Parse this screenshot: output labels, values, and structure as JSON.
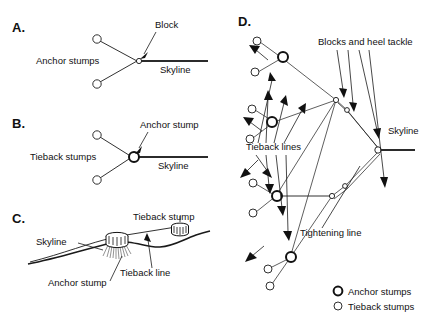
{
  "figure": {
    "background_color": "#ffffff",
    "ink_color": "#1a1a1a",
    "width": 430,
    "height": 321
  },
  "panels": [
    {
      "id": "A",
      "letter": "A.",
      "description": "Plan view of a two-stump anchor with a block on the skyline",
      "labels": {
        "anchor_stumps": "Anchor stumps",
        "block": "Block",
        "skyline": "Skyline"
      }
    },
    {
      "id": "B",
      "letter": "B.",
      "description": "Plan view of an anchor stump tied back to two tieback stumps",
      "labels": {
        "tieback_stumps": "Tieback stumps",
        "anchor_stump": "Anchor stump",
        "skyline": "Skyline"
      }
    },
    {
      "id": "C",
      "letter": "C.",
      "description": "Profile view of an anchor stump tied back up-slope to a tieback stump",
      "labels": {
        "skyline": "Skyline",
        "tieback_stump": "Tieback stump",
        "anchor_stump": "Anchor stump",
        "tieback_line": "Tieback line"
      }
    },
    {
      "id": "D",
      "letter": "D.",
      "description": "Plan view of a multiple-stump anchor system with blocks, heel tackle and tightening line",
      "labels": {
        "blocks_and_heel_tackle": "Blocks and heel tackle",
        "tieback_lines": "Tieback lines",
        "tightening_line": "Tightening line",
        "skyline": "Skyline"
      }
    }
  ],
  "legend": {
    "items": [
      {
        "symbol": "bold-circle",
        "label": "Anchor stumps"
      },
      {
        "symbol": "thin-circle",
        "label": "Tieback stumps"
      }
    ]
  }
}
